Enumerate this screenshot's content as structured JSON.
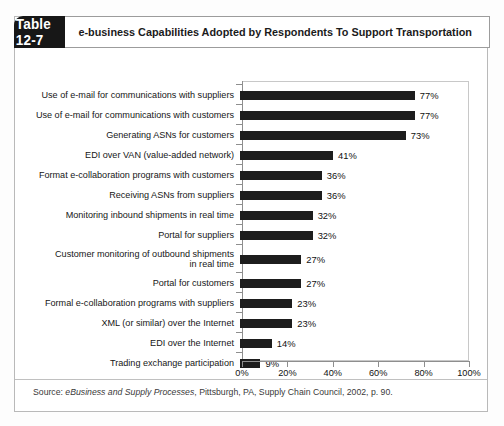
{
  "table": {
    "number_label": "Table 12-7",
    "title": "e-business Capabilities Adopted by Respondents To Support Transportation",
    "source_prefix": "Source: ",
    "source_italic": "eBusiness and Supply Processes",
    "source_suffix": ", Pittsburgh, PA, Supply Chain Council, 2002, p. 90."
  },
  "colors": {
    "header_bg": "#171717",
    "bar": "#1d1d1d",
    "axis": "#8e8e8e",
    "card_border": "#b9b9b9"
  },
  "chart_data": {
    "type": "bar",
    "orientation": "horizontal",
    "title": "e-business Capabilities Adopted by Respondents To Support Transportation",
    "xlabel": "",
    "ylabel": "",
    "xlim": [
      0,
      100
    ],
    "xticks": [
      0,
      20,
      40,
      60,
      80,
      100
    ],
    "xtick_labels": [
      "0%",
      "20%",
      "40%",
      "60%",
      "80%",
      "100%"
    ],
    "grid": false,
    "legend": false,
    "value_suffix": "%",
    "categories": [
      "Use of e-mail for communications with suppliers",
      "Use of e-mail for communications with customers",
      "Generating ASNs for customers",
      "EDI over VAN (value-added network)",
      "Format e-collaboration programs with customers",
      "Receiving ASNs from suppliers",
      "Monitoring inbound shipments in real time",
      "Portal for suppliers",
      "Customer monitoring of outbound shipments\nin real time",
      "Portal for customers",
      "Formal e-collaboration programs with suppliers",
      "XML (or similar) over the Internet",
      "EDI over the Internet",
      "Trading exchange participation"
    ],
    "values": [
      77,
      77,
      73,
      41,
      36,
      36,
      32,
      32,
      27,
      27,
      23,
      23,
      14,
      9
    ],
    "value_labels": [
      "77%",
      "77%",
      "73%",
      "41%",
      "36%",
      "36%",
      "32%",
      "32%",
      "27%",
      "27%",
      "23%",
      "23%",
      "14%",
      "9%"
    ]
  }
}
